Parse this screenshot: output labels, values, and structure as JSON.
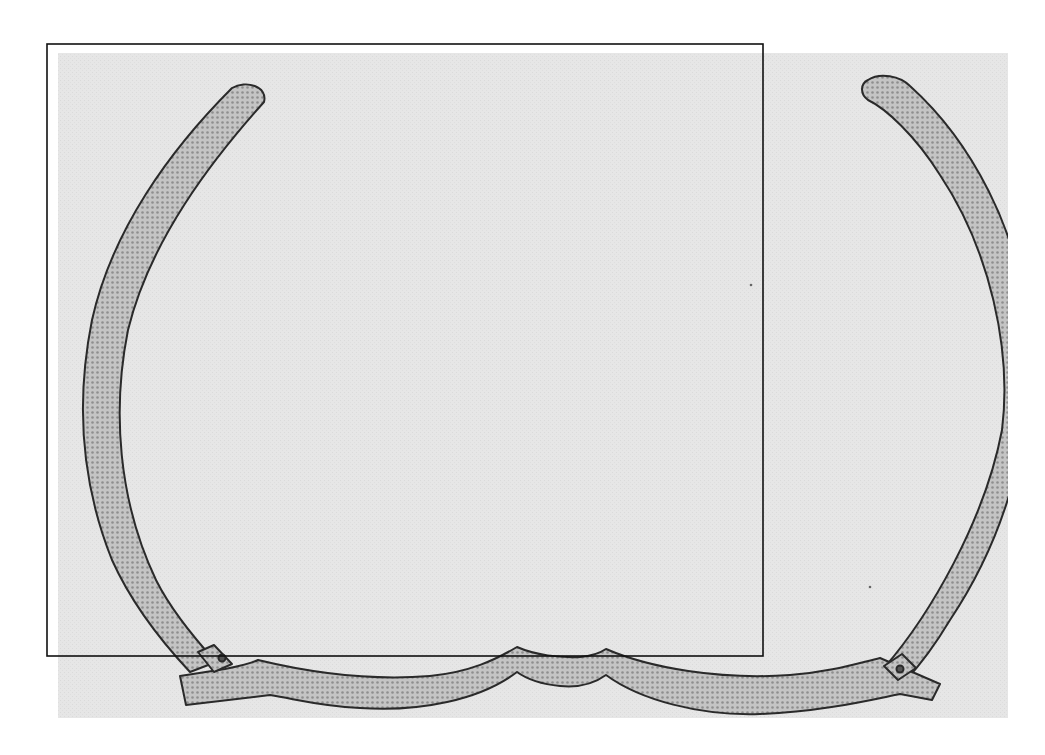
{
  "figure": {
    "caption": "Scanned line drawing of an eyeglass frame with stippled fill and a rectangular selection overlay",
    "colors": {
      "page_background": "#ffffff",
      "panel_background": "#e6e6e6",
      "frame_fill": "#b9b9b9",
      "frame_outline": "#2a2a2a",
      "overlay_rect_stroke": "#111111"
    },
    "panel": {
      "x": 58,
      "y": 53,
      "width": 950,
      "height": 665
    },
    "overlay_rect": {
      "x": 47,
      "y": 44,
      "width": 716,
      "height": 612
    },
    "parts": [
      {
        "name": "left-rim-arc",
        "label": "Left rim"
      },
      {
        "name": "right-rim-arc",
        "label": "Right rim"
      },
      {
        "name": "bridge",
        "label": "Nose bridge"
      },
      {
        "name": "left-hinge",
        "label": "Left hinge"
      },
      {
        "name": "right-hinge",
        "label": "Right hinge"
      }
    ]
  }
}
